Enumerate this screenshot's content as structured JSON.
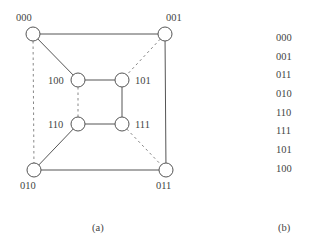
{
  "figure_a": {
    "caption": "(a)",
    "nodes": [
      {
        "id": "000",
        "label": "000",
        "x": 33,
        "y": 34,
        "label_x": 16,
        "label_y": 21
      },
      {
        "id": "001",
        "label": "001",
        "x": 165,
        "y": 34,
        "label_x": 166,
        "label_y": 21
      },
      {
        "id": "100",
        "label": "100",
        "x": 78,
        "y": 80,
        "label_x": 48,
        "label_y": 84
      },
      {
        "id": "101",
        "label": "101",
        "x": 122,
        "y": 80,
        "label_x": 135,
        "label_y": 84
      },
      {
        "id": "110",
        "label": "110",
        "x": 78,
        "y": 124,
        "label_x": 48,
        "label_y": 128
      },
      {
        "id": "111",
        "label": "111",
        "x": 122,
        "y": 124,
        "label_x": 135,
        "label_y": 128
      },
      {
        "id": "010",
        "label": "010",
        "x": 34,
        "y": 170,
        "label_x": 20,
        "label_y": 189
      },
      {
        "id": "011",
        "label": "011",
        "x": 166,
        "y": 170,
        "label_x": 156,
        "label_y": 189
      }
    ],
    "edges": [
      {
        "from": "000",
        "to": "001",
        "style": "solid"
      },
      {
        "from": "000",
        "to": "100",
        "style": "solid"
      },
      {
        "from": "000",
        "to": "010",
        "style": "dashed"
      },
      {
        "from": "001",
        "to": "101",
        "style": "dashed"
      },
      {
        "from": "001",
        "to": "011",
        "style": "solid"
      },
      {
        "from": "100",
        "to": "101",
        "style": "solid"
      },
      {
        "from": "100",
        "to": "110",
        "style": "dashed"
      },
      {
        "from": "101",
        "to": "111",
        "style": "solid"
      },
      {
        "from": "110",
        "to": "111",
        "style": "solid"
      },
      {
        "from": "110",
        "to": "010",
        "style": "solid"
      },
      {
        "from": "111",
        "to": "011",
        "style": "dashed"
      },
      {
        "from": "010",
        "to": "011",
        "style": "solid"
      }
    ]
  },
  "figure_b": {
    "caption": "(b)",
    "sequence": [
      "000",
      "001",
      "011",
      "010",
      "110",
      "111",
      "101",
      "100"
    ]
  }
}
